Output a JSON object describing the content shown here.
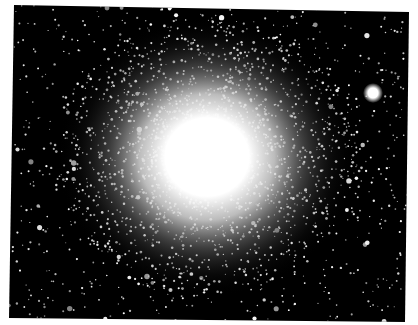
{
  "image": {
    "subject": "globular star cluster",
    "description": "Black-and-white astronomical photograph of a dense globular star cluster with a bright saturated core and a single bright foreground star to the upper right",
    "colors": {
      "background": "#ffffff",
      "sky": "#000000",
      "stars": "#ffffff"
    },
    "cluster_core": {
      "cx": 207,
      "cy": 157,
      "core_radius": 42,
      "halo_radius": 150
    },
    "bright_star": {
      "cx": 373,
      "cy": 93,
      "r": 7
    },
    "frame_corners": [
      [
        14,
        5
      ],
      [
        409,
        12
      ],
      [
        405,
        322
      ],
      [
        9,
        318
      ]
    ]
  }
}
